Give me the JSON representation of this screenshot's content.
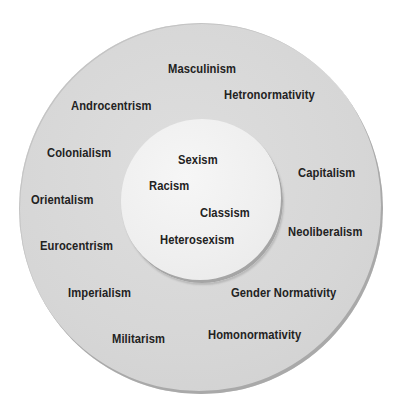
{
  "diagram": {
    "type": "concentric-circles",
    "colors": {
      "background": "#ffffff",
      "outer_fill": "#d8d8d8",
      "inner_fill": "#f0f0f0",
      "edge_shadow": "#a8a8a8",
      "text": "#222222"
    },
    "inner_circle": {
      "labels": [
        {
          "text": "Sexism",
          "x": 178,
          "y": 152
        },
        {
          "text": "Racism",
          "x": 149,
          "y": 178
        },
        {
          "text": "Classism",
          "x": 200,
          "y": 205
        },
        {
          "text": "Heterosexism",
          "x": 160,
          "y": 232
        }
      ]
    },
    "outer_ring": {
      "labels": [
        {
          "text": "Masculinism",
          "x": 168,
          "y": 61
        },
        {
          "text": "Hetronormativity",
          "x": 224,
          "y": 87
        },
        {
          "text": "Androcentrism",
          "x": 71,
          "y": 98
        },
        {
          "text": "Colonialism",
          "x": 47,
          "y": 145
        },
        {
          "text": "Capitalism",
          "x": 298,
          "y": 165
        },
        {
          "text": "Orientalism",
          "x": 31,
          "y": 192
        },
        {
          "text": "Neoliberalism",
          "x": 288,
          "y": 224
        },
        {
          "text": "Eurocentrism",
          "x": 40,
          "y": 238
        },
        {
          "text": "Imperialism",
          "x": 68,
          "y": 285
        },
        {
          "text": "Gender Normativity",
          "x": 231,
          "y": 285
        },
        {
          "text": "Homonormativity",
          "x": 208,
          "y": 327
        },
        {
          "text": "Militarism",
          "x": 112,
          "y": 331
        }
      ]
    }
  }
}
